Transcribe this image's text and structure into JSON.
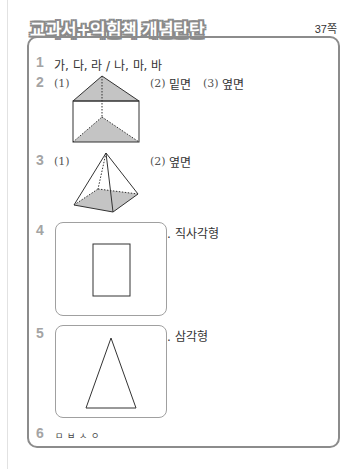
{
  "header": {
    "title": "교과서+익힘책 개념탄탄",
    "page_ref": "37쪽"
  },
  "answers": [
    {
      "number": "1",
      "text": "가, 다, 라 / 나, 마, 바"
    },
    {
      "number": "2",
      "parts": [
        {
          "label": "(1)",
          "figure": "triangular-prism"
        },
        {
          "label": "(2)",
          "text": "밑면"
        },
        {
          "label": "(3)",
          "text": "옆면"
        }
      ]
    },
    {
      "number": "3",
      "parts": [
        {
          "label": "(1)",
          "figure": "square-pyramid"
        },
        {
          "label": "(2)",
          "text": "옆면"
        }
      ]
    },
    {
      "number": "4",
      "figure": "rectangle",
      "text": ". 직사각형"
    },
    {
      "number": "5",
      "figure": "triangle",
      "text": ". 삼각형"
    },
    {
      "number": "6",
      "text": "ㅁㅂㅅㅇ"
    }
  ],
  "colors": {
    "number": "#a4a4a4",
    "border": "#8c8c8c",
    "shade": "#c4c4c4",
    "title_outline": "#8a8a8a"
  }
}
